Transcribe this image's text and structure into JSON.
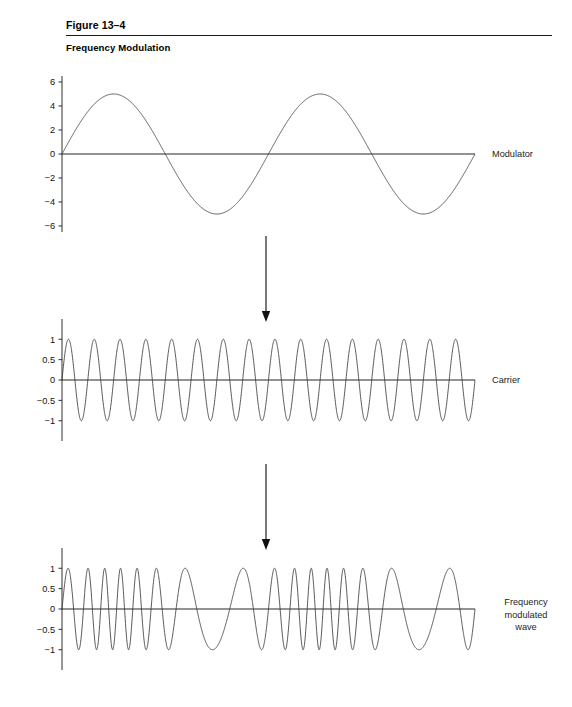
{
  "figure": {
    "number": "Figure 13–4",
    "caption": "Frequency Modulation"
  },
  "plots": [
    {
      "id": "modulator",
      "label": "Modulator",
      "y_ticks": [
        "6",
        "4",
        "2",
        "0",
        "−2",
        "−4",
        "−6"
      ]
    },
    {
      "id": "carrier",
      "label": "Carrier",
      "y_ticks": [
        "1",
        "0.5",
        "0",
        "−0.5",
        "−1"
      ]
    },
    {
      "id": "fm",
      "label": "Frequency\nmodulated\nwave",
      "y_ticks": [
        "1",
        "0.5",
        "0",
        "−0.5",
        "−1"
      ]
    }
  ],
  "arrows": [
    {
      "id": "arrow-modulator-to-carrier"
    },
    {
      "id": "arrow-carrier-to-fm"
    }
  ],
  "colors": {
    "wave_stroke": "#3a3a3a",
    "axis_stroke": "#1a1a1a",
    "text": "#111111",
    "background": "#ffffff"
  },
  "chart_data": [
    {
      "type": "line",
      "id": "modulator",
      "title": "Modulator",
      "xlabel": "",
      "ylabel": "",
      "ylim": [
        -6,
        6
      ],
      "xlim": [
        0,
        2
      ],
      "y_ticks": [
        6,
        4,
        2,
        0,
        -2,
        -4,
        -6
      ],
      "y_tick_labels": [
        "6",
        "4",
        "2",
        "0",
        "−2",
        "−4",
        "−6"
      ],
      "grid": false,
      "legend": false,
      "series": [
        {
          "name": "Modulator",
          "waveform": "sine",
          "amplitude": 5,
          "cycles": 2,
          "phase": 0,
          "baseline": 0
        }
      ]
    },
    {
      "type": "line",
      "id": "carrier",
      "title": "Carrier",
      "xlabel": "",
      "ylabel": "",
      "ylim": [
        -1.35,
        1.35
      ],
      "xlim": [
        0,
        2
      ],
      "y_ticks": [
        1,
        0.5,
        0,
        -0.5,
        -1
      ],
      "y_tick_labels": [
        "1",
        "0.5",
        "0",
        "−0.5",
        "−1"
      ],
      "grid": false,
      "legend": false,
      "series": [
        {
          "name": "Carrier",
          "waveform": "sine",
          "amplitude": 1,
          "cycles": 16,
          "phase": 0,
          "baseline": 0
        }
      ]
    },
    {
      "type": "line",
      "id": "fm",
      "title": "Frequency modulated wave",
      "xlabel": "",
      "ylabel": "",
      "ylim": [
        -1.35,
        1.35
      ],
      "xlim": [
        0,
        2
      ],
      "y_ticks": [
        1,
        0.5,
        0,
        -0.5,
        -1
      ],
      "y_tick_labels": [
        "1",
        "0.5",
        "0",
        "−0.5",
        "−1"
      ],
      "grid": false,
      "legend": false,
      "series": [
        {
          "name": "Frequency modulated wave",
          "waveform": "fm",
          "amplitude": 1,
          "carrier_cycles": 16,
          "modulator_cycles": 2,
          "modulation_index": 5.1,
          "phase": 0,
          "baseline": 0,
          "description": "Carrier sine whose instantaneous frequency follows the modulator: compressed where modulator is negative, stretched where modulator is positive."
        }
      ]
    }
  ],
  "geometry": {
    "plot_left": 62,
    "plot_width": 413,
    "modulator": {
      "top": 82,
      "zero_y": 154,
      "half_height": 72
    },
    "carrier": {
      "top": 325,
      "zero_y": 380,
      "half_height": 55
    },
    "fm": {
      "top": 553,
      "zero_y": 609,
      "half_height": 55
    },
    "label_x": 492,
    "arrow_x": 266,
    "arrow1": {
      "y1": 236,
      "y2": 322
    },
    "arrow2": {
      "y1": 464,
      "y2": 550
    }
  }
}
